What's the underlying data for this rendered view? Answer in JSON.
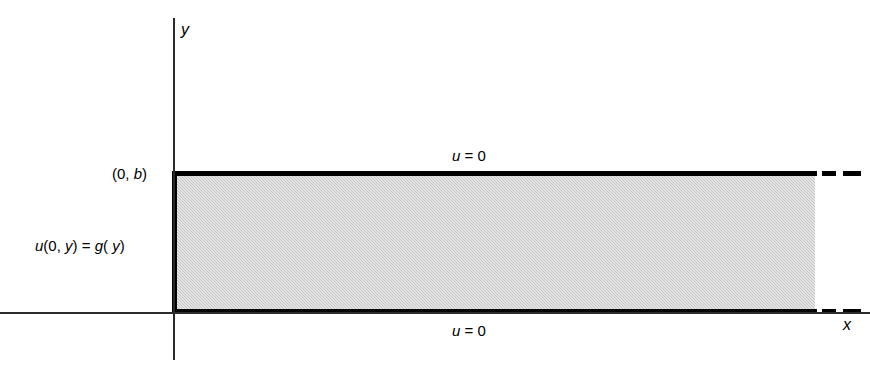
{
  "figure": {
    "type": "math-diagram",
    "background_color": "#ffffff",
    "region_fill_color": "#c4c4c4",
    "line_color": "#000000"
  },
  "axes": {
    "y_label": "y",
    "x_label": "x"
  },
  "labels": {
    "corner_point": "(0, b)",
    "left_boundary_condition_u": "u",
    "left_boundary_condition_rest": "(0, ",
    "left_boundary_condition": "u(0, y) = g( y)",
    "top_boundary_condition": "u = 0",
    "bottom_boundary_condition": "u = 0"
  },
  "chart_data": {
    "type": "diagram",
    "title": "",
    "xlabel": "x",
    "ylabel": "y",
    "region": {
      "name": "semi-infinite strip",
      "x_range": [
        "0",
        "infinity"
      ],
      "y_range": [
        "0",
        "b"
      ],
      "shaded": true
    },
    "boundary_conditions": [
      {
        "edge": "top",
        "location": "y = b",
        "text": "u = 0"
      },
      {
        "edge": "bottom",
        "location": "y = 0",
        "text": "u = 0"
      },
      {
        "edge": "left",
        "location": "x = 0",
        "text": "u(0, y) = g( y)"
      }
    ],
    "annotated_points": [
      {
        "label": "(0, b)",
        "x": 0,
        "y": "b"
      }
    ]
  }
}
